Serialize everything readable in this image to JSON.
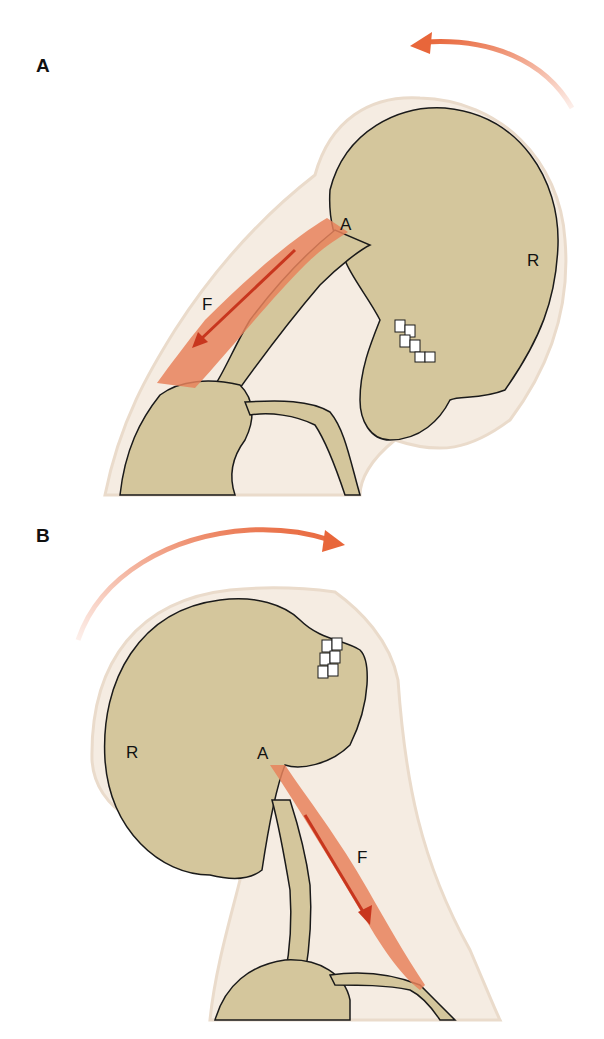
{
  "panels": [
    {
      "id": "A",
      "label": "A",
      "motion": "flexion",
      "rotation_arrow_direction": "counterclockwise",
      "labels": {
        "attachment": "A",
        "muscle": "F",
        "rotation_center": "R"
      }
    },
    {
      "id": "B",
      "label": "B",
      "motion": "extension",
      "rotation_arrow_direction": "clockwise",
      "labels": {
        "attachment": "A",
        "muscle": "F",
        "rotation_center": "R"
      }
    }
  ],
  "colors": {
    "bone": "#D4C69C",
    "body_outline": "#F5ECE2",
    "muscle": "#E8835C",
    "arrow": "#E8663A",
    "force_arrow": "#C8361E",
    "line": "#1A1A1A"
  }
}
